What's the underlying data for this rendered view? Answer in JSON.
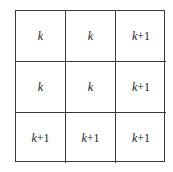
{
  "grid": {
    "rows": [
      [
        {
          "var": "k",
          "suffix": ""
        },
        {
          "var": "k",
          "suffix": ""
        },
        {
          "var": "k",
          "suffix": "+1"
        }
      ],
      [
        {
          "var": "k",
          "suffix": ""
        },
        {
          "var": "k",
          "suffix": ""
        },
        {
          "var": "k",
          "suffix": "+1"
        }
      ],
      [
        {
          "var": "k",
          "suffix": "+1"
        },
        {
          "var": "k",
          "suffix": "+1"
        },
        {
          "var": "k",
          "suffix": "+1"
        }
      ]
    ]
  }
}
